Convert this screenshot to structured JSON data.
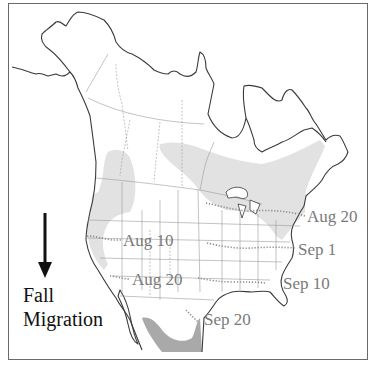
{
  "map": {
    "title": "Fall Migration",
    "legend": {
      "line1": "Fall",
      "line2": "Migration",
      "arrow": "down-arrow-icon"
    },
    "colors": {
      "breeding_range": "#e2e2e2",
      "wintering_range": "#a9a9a9",
      "coastline": "#3a3a3a",
      "borders": "#9a9a9a",
      "date_labels": "#7a7a7a",
      "migration_front": "#8a8a8a"
    },
    "migration_fronts": [
      {
        "label": "Aug 10"
      },
      {
        "label": "Aug 20",
        "region": "west"
      },
      {
        "label": "Aug 20",
        "region": "east"
      },
      {
        "label": "Sep 1"
      },
      {
        "label": "Sep 10"
      },
      {
        "label": "Sep 20"
      }
    ]
  }
}
